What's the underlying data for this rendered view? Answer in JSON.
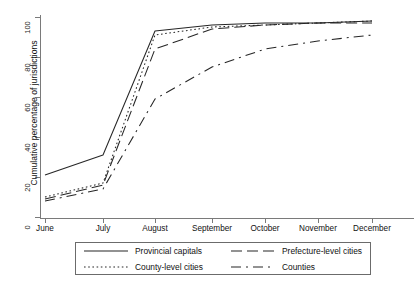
{
  "chart_data": {
    "type": "line",
    "title": "",
    "xlabel": "",
    "ylabel": "Cumulative percentage of jurisdictions",
    "categories": [
      "June",
      "July",
      "August",
      "September",
      "October",
      "November",
      "December"
    ],
    "x": [
      0,
      1,
      2,
      3,
      4,
      5,
      6
    ],
    "ylim": [
      0,
      100
    ],
    "yticks": [
      0,
      20,
      40,
      60,
      80,
      100
    ],
    "ytick_labels": [
      "0",
      "20",
      "40",
      "60",
      "80",
      "100"
    ],
    "grid": false,
    "legend_position": "below-plot",
    "series": [
      {
        "name": "Provincial capitals",
        "style": "solid",
        "color": "#262626",
        "values": [
          21,
          31,
          93,
          96,
          97,
          97,
          98
        ]
      },
      {
        "name": "Prefecture-level cities",
        "style": "long-dash",
        "color": "#262626",
        "values": [
          9,
          16,
          84,
          94,
          96,
          97,
          97
        ]
      },
      {
        "name": "County-level cities",
        "style": "dotted",
        "color": "#262626",
        "values": [
          10,
          17,
          91,
          95,
          96,
          97,
          98
        ]
      },
      {
        "name": "Counties",
        "style": "dash-dot",
        "color": "#262626",
        "values": [
          8,
          14,
          59,
          75,
          84,
          88,
          91
        ]
      }
    ]
  },
  "axes": {
    "y_title": "Cumulative percentage of jurisdictions",
    "y_labels": [
      "0",
      "20",
      "40",
      "60",
      "80",
      "100"
    ],
    "x_labels": [
      "June",
      "July",
      "August",
      "September",
      "October",
      "November",
      "December"
    ]
  },
  "legend": {
    "entries": [
      {
        "label": "Provincial capitals",
        "style": "solid"
      },
      {
        "label": "Prefecture-level cities",
        "style": "long-dash"
      },
      {
        "label": "County-level cities",
        "style": "dotted"
      },
      {
        "label": "Counties",
        "style": "dash-dot"
      }
    ]
  }
}
